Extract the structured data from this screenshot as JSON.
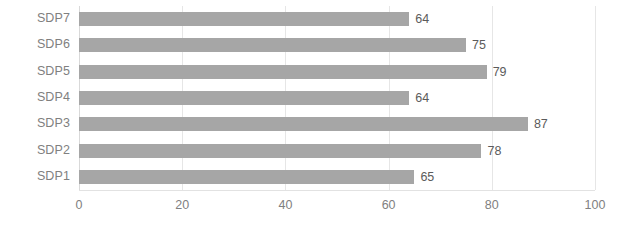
{
  "chart_data": {
    "type": "bar",
    "orientation": "horizontal",
    "title": "",
    "subtitle": "",
    "xlabel": "",
    "ylabel": "",
    "categories": [
      "SDP7",
      "SDP6",
      "SDP5",
      "SDP4",
      "SDP3",
      "SDP2",
      "SDP1"
    ],
    "values": [
      64,
      75,
      79,
      64,
      87,
      78,
      65
    ],
    "data_labels": [
      "64",
      "75",
      "79",
      "64",
      "87",
      "78",
      "65"
    ],
    "xlim": [
      0,
      100
    ],
    "xticks": [
      0,
      20,
      40,
      60,
      80,
      100
    ],
    "xtick_labels": [
      "0",
      "20",
      "40",
      "60",
      "80",
      "100"
    ],
    "grid": true,
    "grid_axis": "x",
    "legend": false,
    "legend_position": "none",
    "series": [
      {
        "name": "",
        "values": [
          64,
          75,
          79,
          64,
          87,
          78,
          65
        ],
        "color": "#a6a6a6"
      }
    ]
  },
  "colors": {
    "bar": "#a6a6a6",
    "gridline": "#e6e6e6",
    "axis": "#d9d9d9",
    "category_label_text": "#808080",
    "tick_label_text": "#808080",
    "value_label_text": "#5b5b5b",
    "background": "#ffffff"
  }
}
